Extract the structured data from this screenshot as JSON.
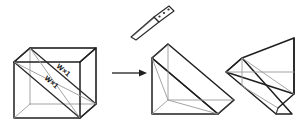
{
  "figure": {
    "title": "Cube cut diagonally into two triangular wedges",
    "background_color": "#ffffff",
    "line_color": "#1f1f1f",
    "hidden_line_color": "#9a9a9a",
    "stages": [
      {
        "id": "cube",
        "label": "cube-with-diagonal-cut"
      },
      {
        "id": "wedge-left",
        "label": "triangular-prism-wedge-left"
      },
      {
        "id": "wedge-right",
        "label": "triangular-prism-wedge-right"
      }
    ]
  },
  "labels": {
    "dimension_upper": "W×1",
    "dimension_lower": "W×1"
  },
  "tool": {
    "name": "knife",
    "rivet_count": 3
  },
  "arrow": {
    "direction": "right",
    "label": ""
  }
}
